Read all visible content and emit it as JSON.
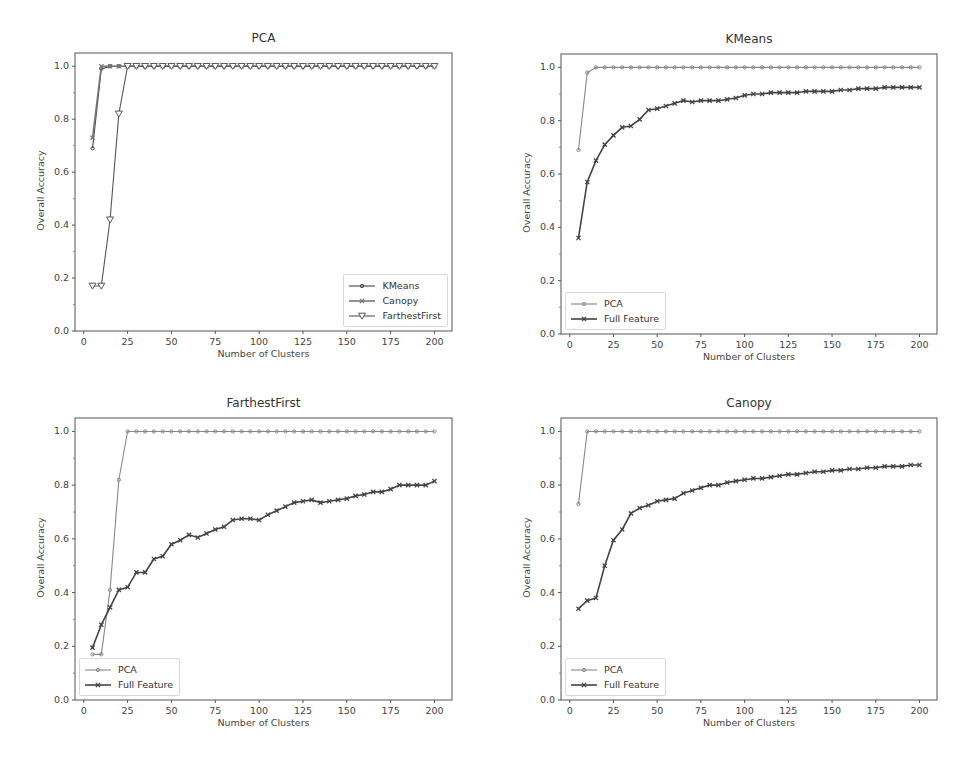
{
  "chart_data": [
    {
      "type": "line",
      "title": "PCA",
      "xlabel": "Number of Clusters",
      "ylabel": "Overall Accuracy",
      "xlim": [
        -5,
        210
      ],
      "ylim": [
        0.0,
        1.05
      ],
      "xticks": [
        "0",
        "25",
        "50",
        "75",
        "100",
        "125",
        "150",
        "175",
        "200"
      ],
      "yticks": [
        "0.0",
        "0.2",
        "0.4",
        "0.6",
        "0.8",
        "1.0"
      ],
      "grid": false,
      "legend_position": "lower right",
      "x": [
        5,
        10,
        15,
        20,
        25,
        30,
        35,
        40,
        45,
        50,
        55,
        60,
        65,
        70,
        75,
        80,
        85,
        90,
        95,
        100,
        105,
        110,
        115,
        120,
        125,
        130,
        135,
        140,
        145,
        150,
        155,
        160,
        165,
        170,
        175,
        180,
        185,
        190,
        195,
        200
      ],
      "series": [
        {
          "name": "KMeans",
          "marker": "o",
          "color": "#444444",
          "values": [
            0.69,
            0.99,
            1.0,
            1.0,
            1.0,
            1.0,
            1.0,
            1.0,
            1.0,
            1.0,
            1.0,
            1.0,
            1.0,
            1.0,
            1.0,
            1.0,
            1.0,
            1.0,
            1.0,
            1.0,
            1.0,
            1.0,
            1.0,
            1.0,
            1.0,
            1.0,
            1.0,
            1.0,
            1.0,
            1.0,
            1.0,
            1.0,
            1.0,
            1.0,
            1.0,
            1.0,
            1.0,
            1.0,
            1.0,
            1.0
          ]
        },
        {
          "name": "Canopy",
          "marker": "x",
          "color": "#777777",
          "values": [
            0.73,
            1.0,
            1.0,
            1.0,
            1.0,
            1.0,
            1.0,
            1.0,
            1.0,
            1.0,
            1.0,
            1.0,
            1.0,
            1.0,
            1.0,
            1.0,
            1.0,
            1.0,
            1.0,
            1.0,
            1.0,
            1.0,
            1.0,
            1.0,
            1.0,
            1.0,
            1.0,
            1.0,
            1.0,
            1.0,
            1.0,
            1.0,
            1.0,
            1.0,
            1.0,
            1.0,
            1.0,
            1.0,
            1.0,
            1.0
          ]
        },
        {
          "name": "FarthestFirst",
          "marker": "v",
          "color": "#555555",
          "values": [
            0.17,
            0.17,
            0.42,
            0.82,
            1.0,
            1.0,
            1.0,
            1.0,
            1.0,
            1.0,
            1.0,
            1.0,
            1.0,
            1.0,
            1.0,
            1.0,
            1.0,
            1.0,
            1.0,
            1.0,
            1.0,
            1.0,
            1.0,
            1.0,
            1.0,
            1.0,
            1.0,
            1.0,
            1.0,
            1.0,
            1.0,
            1.0,
            1.0,
            1.0,
            1.0,
            1.0,
            1.0,
            1.0,
            1.0,
            1.0
          ]
        }
      ]
    },
    {
      "type": "line",
      "title": "KMeans",
      "xlabel": "Number of Clusters",
      "ylabel": "Overall Accuracy",
      "xlim": [
        -5,
        210
      ],
      "ylim": [
        0.0,
        1.05
      ],
      "xticks": [
        "0",
        "25",
        "50",
        "75",
        "100",
        "125",
        "150",
        "175",
        "200"
      ],
      "yticks": [
        "0.0",
        "0.2",
        "0.4",
        "0.6",
        "0.8",
        "1.0"
      ],
      "grid": false,
      "legend_position": "lower left",
      "x": [
        5,
        10,
        15,
        20,
        25,
        30,
        35,
        40,
        45,
        50,
        55,
        60,
        65,
        70,
        75,
        80,
        85,
        90,
        95,
        100,
        105,
        110,
        115,
        120,
        125,
        130,
        135,
        140,
        145,
        150,
        155,
        160,
        165,
        170,
        175,
        180,
        185,
        190,
        195,
        200
      ],
      "series": [
        {
          "name": "PCA",
          "marker": "o",
          "color": "#888888",
          "values": [
            0.69,
            0.98,
            1.0,
            1.0,
            1.0,
            1.0,
            1.0,
            1.0,
            1.0,
            1.0,
            1.0,
            1.0,
            1.0,
            1.0,
            1.0,
            1.0,
            1.0,
            1.0,
            1.0,
            1.0,
            1.0,
            1.0,
            1.0,
            1.0,
            1.0,
            1.0,
            1.0,
            1.0,
            1.0,
            1.0,
            1.0,
            1.0,
            1.0,
            1.0,
            1.0,
            1.0,
            1.0,
            1.0,
            1.0,
            1.0
          ]
        },
        {
          "name": "Full Feature",
          "marker": "x",
          "color": "#444444",
          "values": [
            0.36,
            0.57,
            0.65,
            0.71,
            0.745,
            0.775,
            0.78,
            0.805,
            0.84,
            0.845,
            0.855,
            0.865,
            0.875,
            0.87,
            0.875,
            0.875,
            0.875,
            0.88,
            0.885,
            0.895,
            0.9,
            0.9,
            0.905,
            0.905,
            0.905,
            0.905,
            0.91,
            0.91,
            0.91,
            0.91,
            0.915,
            0.915,
            0.92,
            0.92,
            0.92,
            0.925,
            0.925,
            0.925,
            0.925,
            0.925
          ]
        }
      ]
    },
    {
      "type": "line",
      "title": "FarthestFirst",
      "xlabel": "Number of Clusters",
      "ylabel": "Overall Accuracy",
      "xlim": [
        -5,
        210
      ],
      "ylim": [
        0.0,
        1.05
      ],
      "xticks": [
        "0",
        "25",
        "50",
        "75",
        "100",
        "125",
        "150",
        "175",
        "200"
      ],
      "yticks": [
        "0.0",
        "0.2",
        "0.4",
        "0.6",
        "0.8",
        "1.0"
      ],
      "grid": false,
      "legend_position": "lower left",
      "x": [
        5,
        10,
        15,
        20,
        25,
        30,
        35,
        40,
        45,
        50,
        55,
        60,
        65,
        70,
        75,
        80,
        85,
        90,
        95,
        100,
        105,
        110,
        115,
        120,
        125,
        130,
        135,
        140,
        145,
        150,
        155,
        160,
        165,
        170,
        175,
        180,
        185,
        190,
        195,
        200
      ],
      "series": [
        {
          "name": "PCA",
          "marker": "o",
          "color": "#888888",
          "values": [
            0.17,
            0.17,
            0.41,
            0.82,
            1.0,
            1.0,
            1.0,
            1.0,
            1.0,
            1.0,
            1.0,
            1.0,
            1.0,
            1.0,
            1.0,
            1.0,
            1.0,
            1.0,
            1.0,
            1.0,
            1.0,
            1.0,
            1.0,
            1.0,
            1.0,
            1.0,
            1.0,
            1.0,
            1.0,
            1.0,
            1.0,
            1.0,
            1.0,
            1.0,
            1.0,
            1.0,
            1.0,
            1.0,
            1.0,
            1.0
          ]
        },
        {
          "name": "Full Feature",
          "marker": "x",
          "color": "#444444",
          "values": [
            0.195,
            0.28,
            0.345,
            0.41,
            0.42,
            0.475,
            0.475,
            0.525,
            0.535,
            0.58,
            0.595,
            0.615,
            0.605,
            0.62,
            0.635,
            0.645,
            0.67,
            0.675,
            0.675,
            0.67,
            0.69,
            0.705,
            0.72,
            0.735,
            0.74,
            0.745,
            0.735,
            0.74,
            0.745,
            0.75,
            0.76,
            0.765,
            0.775,
            0.775,
            0.785,
            0.8,
            0.8,
            0.8,
            0.8,
            0.815
          ]
        }
      ]
    },
    {
      "type": "line",
      "title": "Canopy",
      "xlabel": "Number of Clusters",
      "ylabel": "Overall Accuracy",
      "xlim": [
        -5,
        210
      ],
      "ylim": [
        0.0,
        1.05
      ],
      "xticks": [
        "0",
        "25",
        "50",
        "75",
        "100",
        "125",
        "150",
        "175",
        "200"
      ],
      "yticks": [
        "0.0",
        "0.2",
        "0.4",
        "0.6",
        "0.8",
        "1.0"
      ],
      "grid": false,
      "legend_position": "lower left",
      "x": [
        5,
        10,
        15,
        20,
        25,
        30,
        35,
        40,
        45,
        50,
        55,
        60,
        65,
        70,
        75,
        80,
        85,
        90,
        95,
        100,
        105,
        110,
        115,
        120,
        125,
        130,
        135,
        140,
        145,
        150,
        155,
        160,
        165,
        170,
        175,
        180,
        185,
        190,
        195,
        200
      ],
      "series": [
        {
          "name": "PCA",
          "marker": "o",
          "color": "#888888",
          "values": [
            0.73,
            1.0,
            1.0,
            1.0,
            1.0,
            1.0,
            1.0,
            1.0,
            1.0,
            1.0,
            1.0,
            1.0,
            1.0,
            1.0,
            1.0,
            1.0,
            1.0,
            1.0,
            1.0,
            1.0,
            1.0,
            1.0,
            1.0,
            1.0,
            1.0,
            1.0,
            1.0,
            1.0,
            1.0,
            1.0,
            1.0,
            1.0,
            1.0,
            1.0,
            1.0,
            1.0,
            1.0,
            1.0,
            1.0,
            1.0
          ]
        },
        {
          "name": "Full Feature",
          "marker": "x",
          "color": "#444444",
          "values": [
            0.34,
            0.37,
            0.38,
            0.5,
            0.595,
            0.635,
            0.695,
            0.715,
            0.725,
            0.74,
            0.745,
            0.75,
            0.77,
            0.78,
            0.79,
            0.8,
            0.8,
            0.81,
            0.815,
            0.82,
            0.825,
            0.825,
            0.83,
            0.835,
            0.84,
            0.84,
            0.845,
            0.85,
            0.85,
            0.855,
            0.855,
            0.86,
            0.86,
            0.865,
            0.865,
            0.87,
            0.87,
            0.87,
            0.875,
            0.875
          ]
        }
      ]
    }
  ]
}
